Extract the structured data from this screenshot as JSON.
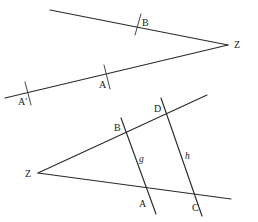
{
  "figure": {
    "background_color": "#ffffff",
    "stroke_color": "#2a2a2a",
    "label_color": "#1b1b1b",
    "width": 258,
    "height": 222
  },
  "upper_figure": {
    "name": "upper-angle",
    "vertex_label": "Z",
    "vertex": {
      "x": 228,
      "y": 45
    },
    "vertex_label_pos": {
      "x": 234,
      "y": 48
    },
    "rays": [
      {
        "name": "upper-ray",
        "x1": 50,
        "y1": 10,
        "x2": 228,
        "y2": 45
      },
      {
        "name": "lower-ray",
        "x1": 5,
        "y1": 98,
        "x2": 228,
        "y2": 45
      }
    ],
    "marks": [
      {
        "name": "point-B-tick",
        "label": "B",
        "label_pos": {
          "x": 142,
          "y": 26
        },
        "tick": {
          "x1": 135,
          "y1": 35,
          "x2": 141,
          "y2": 14
        }
      },
      {
        "name": "point-A-tick",
        "label": "A",
        "label_pos": {
          "x": 99,
          "y": 88
        },
        "tick": {
          "x1": 110,
          "y1": 89,
          "x2": 104,
          "y2": 65
        }
      },
      {
        "name": "point-A-prime-tick",
        "label": "A'",
        "label_pos": {
          "x": 18,
          "y": 105
        },
        "tick": {
          "x1": 31,
          "y1": 105,
          "x2": 25,
          "y2": 82
        }
      }
    ]
  },
  "lower_figure": {
    "name": "lower-angle-with-transversals",
    "vertex_label": "Z",
    "vertex": {
      "x": 38,
      "y": 173
    },
    "vertex_label_pos": {
      "x": 25,
      "y": 177
    },
    "rays": [
      {
        "name": "upper-ray",
        "x1": 38,
        "y1": 173,
        "x2": 207,
        "y2": 95
      },
      {
        "name": "lower-ray",
        "x1": 38,
        "y1": 173,
        "x2": 231,
        "y2": 199
      }
    ],
    "transversals": [
      {
        "name": "line-g",
        "label": "g",
        "label_pos": {
          "x": 139,
          "y": 162
        },
        "x1": 121,
        "y1": 118,
        "x2": 156,
        "y2": 214
      },
      {
        "name": "line-h",
        "label": "h",
        "label_pos": {
          "x": 185,
          "y": 159
        },
        "x1": 161,
        "y1": 98,
        "x2": 202,
        "y2": 216
      }
    ],
    "points": [
      {
        "name": "point-B",
        "label": "B",
        "x": 124,
        "y": 130,
        "label_pos": {
          "x": 114,
          "y": 131
        }
      },
      {
        "name": "point-D",
        "label": "D",
        "x": 165,
        "y": 110,
        "label_pos": {
          "x": 154,
          "y": 112
        }
      },
      {
        "name": "point-A",
        "label": "A",
        "x": 148,
        "y": 196,
        "label_pos": {
          "x": 139,
          "y": 207
        }
      },
      {
        "name": "point-C",
        "label": "C",
        "x": 194,
        "y": 199,
        "label_pos": {
          "x": 192,
          "y": 211
        }
      }
    ]
  }
}
